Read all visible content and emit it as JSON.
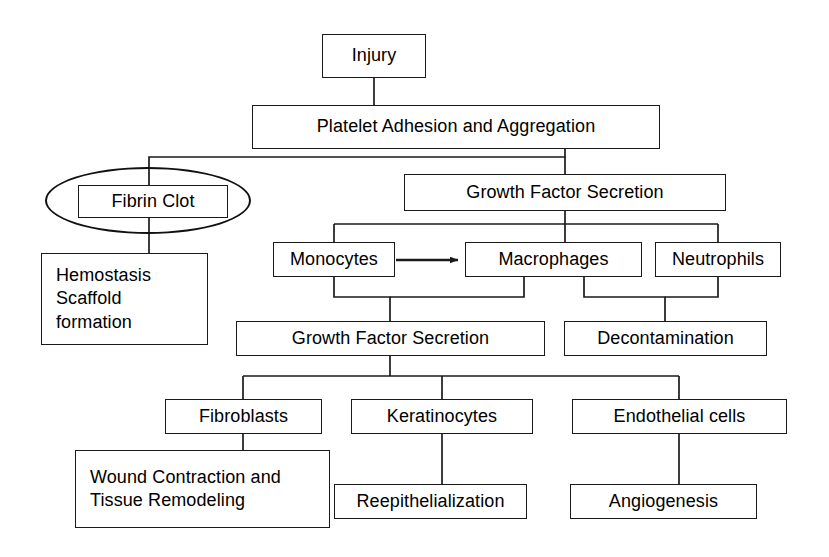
{
  "diagram": {
    "type": "flowchart",
    "orientation": "top-down",
    "background_color": "#ffffff",
    "line_color": "#1a1a1a",
    "text_color": "#000000",
    "nodes": [
      {
        "id": "injury",
        "label": "Injury",
        "x": 322,
        "y": 34,
        "w": 104,
        "h": 44,
        "align": "center"
      },
      {
        "id": "platelet",
        "label": "Platelet Adhesion and Aggregation",
        "x": 252,
        "y": 105,
        "w": 408,
        "h": 44,
        "align": "center"
      },
      {
        "id": "fibrin-clot",
        "label": "Fibrin Clot",
        "x": 78,
        "y": 185,
        "w": 150,
        "h": 33,
        "align": "center"
      },
      {
        "id": "hemostasis",
        "label": "Hemostasis\nScaffold\nformation",
        "x": 41,
        "y": 253,
        "w": 167,
        "h": 92,
        "align": "left"
      },
      {
        "id": "gfs-top",
        "label": "Growth Factor Secretion",
        "x": 404,
        "y": 174,
        "w": 322,
        "h": 37,
        "align": "center"
      },
      {
        "id": "monocytes",
        "label": "Monocytes",
        "x": 273,
        "y": 242,
        "w": 122,
        "h": 35,
        "align": "center"
      },
      {
        "id": "macrophages",
        "label": "Macrophages",
        "x": 465,
        "y": 242,
        "w": 177,
        "h": 35,
        "align": "center"
      },
      {
        "id": "neutrophils",
        "label": "Neutrophils",
        "x": 655,
        "y": 242,
        "w": 126,
        "h": 35,
        "align": "center"
      },
      {
        "id": "gfs-bottom",
        "label": "Growth Factor Secretion",
        "x": 236,
        "y": 321,
        "w": 309,
        "h": 35,
        "align": "center"
      },
      {
        "id": "decontamination",
        "label": "Decontamination",
        "x": 564,
        "y": 321,
        "w": 203,
        "h": 35,
        "align": "center"
      },
      {
        "id": "fibroblasts",
        "label": "Fibroblasts",
        "x": 165,
        "y": 399,
        "w": 157,
        "h": 35,
        "align": "center"
      },
      {
        "id": "keratinocytes",
        "label": "Keratinocytes",
        "x": 351,
        "y": 399,
        "w": 182,
        "h": 35,
        "align": "center"
      },
      {
        "id": "endothelial-cells",
        "label": "Endothelial cells",
        "x": 572,
        "y": 399,
        "w": 215,
        "h": 35,
        "align": "center"
      },
      {
        "id": "wound-contraction",
        "label": "Wound Contraction and\nTissue Remodeling",
        "x": 75,
        "y": 450,
        "w": 255,
        "h": 78,
        "align": "left"
      },
      {
        "id": "reepithelialization",
        "label": "Reepithelialization",
        "x": 334,
        "y": 484,
        "w": 193,
        "h": 35,
        "align": "center"
      },
      {
        "id": "angiogenesis",
        "label": "Angiogenesis",
        "x": 570,
        "y": 484,
        "w": 187,
        "h": 35,
        "align": "center"
      }
    ],
    "highlight": {
      "id": "fibrin-clot-highlight",
      "shape": "ellipse",
      "target": "fibrin-clot",
      "x": 45,
      "y": 167,
      "w": 206,
      "h": 67
    },
    "edges": [
      {
        "from": "injury",
        "to": "platelet",
        "style": "orthogonal",
        "arrow": false
      },
      {
        "from": "platelet",
        "to": "fibrin-clot",
        "style": "orthogonal",
        "arrow": false
      },
      {
        "from": "platelet",
        "to": "gfs-top",
        "style": "orthogonal",
        "arrow": false
      },
      {
        "from": "fibrin-clot",
        "to": "hemostasis",
        "style": "orthogonal",
        "arrow": false
      },
      {
        "from": "gfs-top",
        "to": "monocytes",
        "style": "orthogonal",
        "arrow": false
      },
      {
        "from": "gfs-top",
        "to": "macrophages",
        "style": "orthogonal",
        "arrow": false
      },
      {
        "from": "gfs-top",
        "to": "neutrophils",
        "style": "orthogonal",
        "arrow": false
      },
      {
        "from": "monocytes",
        "to": "macrophages",
        "style": "straight",
        "arrow": true
      },
      {
        "from": "monocytes",
        "to": "gfs-bottom",
        "style": "orthogonal",
        "arrow": false
      },
      {
        "from": "macrophages",
        "to": "gfs-bottom",
        "style": "orthogonal",
        "arrow": false
      },
      {
        "from": "macrophages",
        "to": "decontamination",
        "style": "orthogonal",
        "arrow": false
      },
      {
        "from": "neutrophils",
        "to": "decontamination",
        "style": "orthogonal",
        "arrow": false
      },
      {
        "from": "gfs-bottom",
        "to": "fibroblasts",
        "style": "orthogonal",
        "arrow": false
      },
      {
        "from": "gfs-bottom",
        "to": "keratinocytes",
        "style": "orthogonal",
        "arrow": false
      },
      {
        "from": "gfs-bottom",
        "to": "endothelial-cells",
        "style": "orthogonal",
        "arrow": false
      },
      {
        "from": "fibroblasts",
        "to": "wound-contraction",
        "style": "orthogonal",
        "arrow": false
      },
      {
        "from": "keratinocytes",
        "to": "reepithelialization",
        "style": "orthogonal",
        "arrow": false
      },
      {
        "from": "endothelial-cells",
        "to": "angiogenesis",
        "style": "orthogonal",
        "arrow": false
      }
    ],
    "edge_paths": {
      "injury-platelet": "M 374,78 L 374,105",
      "platelet-branch": "M 149,157 L 565,157 M 149,157 L 149,185 M 565,149 L 565,157 M 565,157 L 565,174",
      "fibrin-hemostasis": "M 149,218 L 149,253",
      "gfs-top-fanout": "M 565,211 L 565,242 M 334,224 L 718,224 M 334,224 L 334,242 M 718,224 L 718,242",
      "monocytes-arrow": "M 395,260 L 459,260",
      "monocytes-gfs-bottom": "M 334,277 L 334,297 L 390,297 L 390,321",
      "macrophages-gfs-bottom": "M 524,277 L 524,297 L 390,297",
      "macrophages-decontamination": "M 584,277 L 584,297 L 665,297 L 665,321",
      "neutrophils-decontamination": "M 718,277 L 718,297 L 665,297",
      "gfs-bottom-fanout": "M 390,356 L 390,376 M 243,376 L 679,376 M 243,376 L 243,399 M 442,376 L 442,399 M 679,376 L 679,399",
      "fibroblasts-wound": "M 243,434 L 243,450",
      "keratinocytes-reepithelial": "M 442,434 L 442,484",
      "endothelial-angiogenesis": "M 679,434 L 679,484"
    }
  }
}
